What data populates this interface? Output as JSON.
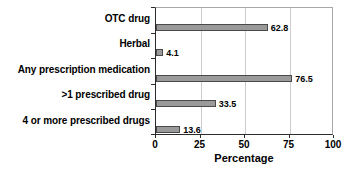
{
  "chart_data": {
    "type": "bar",
    "orientation": "horizontal",
    "title": "",
    "xlabel": "Percentage",
    "ylabel": "",
    "categories": [
      "OTC drug",
      "Herbal",
      "Any prescription medication",
      ">1 prescribed drug",
      "4 or more prescribed drugs"
    ],
    "values": [
      62.8,
      4.1,
      76.5,
      33.5,
      13.6
    ],
    "value_labels": [
      "62.8",
      "4.1",
      "76.5",
      "33.5",
      "13.6"
    ],
    "xlim": [
      0,
      100
    ],
    "xticks": [
      0,
      25,
      50,
      75,
      100
    ],
    "xtick_labels": [
      "0",
      "25",
      "50",
      "75",
      "100"
    ],
    "grid": "vertical",
    "legend": "none",
    "bar_color": "#9a9a9a",
    "bar_edge_color": "#4a4a4a",
    "gridline_color": "#cccccc",
    "axis_color": "#2b2b2b",
    "text_color": "#000000",
    "background": "#ffffff"
  }
}
